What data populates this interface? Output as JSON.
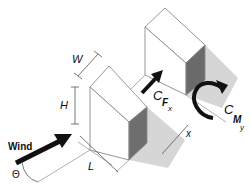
{
  "diagram": {
    "labels": {
      "width": "W",
      "height": "H",
      "length": "L",
      "wind": "Wind",
      "angle": "Θ",
      "force_coefficient_main": "C",
      "force_coefficient_sub1": "F",
      "force_coefficient_sub2": "x",
      "moment_coefficient_main": "C",
      "moment_coefficient_sub1": "M",
      "moment_coefficient_sub2": "y",
      "spacing": "x"
    },
    "colors": {
      "background": "#ffffff",
      "face_light": "#ffffff",
      "face_dark": "#6e6e6e",
      "shadow": "#d4d4d4",
      "outline": "#8a8a8a",
      "arrow": "#111111"
    }
  }
}
